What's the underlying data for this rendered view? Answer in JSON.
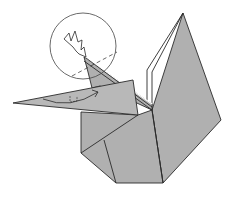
{
  "diagram": {
    "type": "origami-step",
    "colors": {
      "paper": "#b0b0b0",
      "paper_light": "#bdbdbd",
      "paper_white": "#ffffff",
      "line": "#2a2a2a",
      "background": "#ffffff"
    },
    "annotations": [
      {
        "kind": "detail-circle",
        "label": "zoom-circle"
      },
      {
        "kind": "valley-fold-line",
        "label": "dashed fold line"
      },
      {
        "kind": "sink-arrow",
        "label": "push-in arrow"
      },
      {
        "kind": "curved-arrow",
        "label": "fold direction arrow"
      },
      {
        "kind": "right-angle-mark",
        "label": "right angle"
      }
    ]
  }
}
